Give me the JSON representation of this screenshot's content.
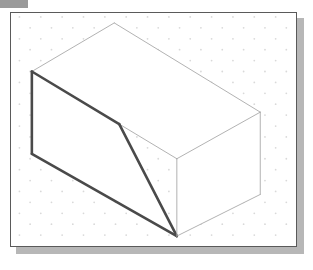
{
  "page": {
    "background_color": "#ffffff",
    "width": 313,
    "height": 270
  },
  "corner_tab": {
    "name": "page-corner-tab",
    "color": "#9a9a9a",
    "x": 0,
    "y": 0,
    "width": 28,
    "height": 8
  },
  "panel": {
    "name": "figure-panel",
    "x": 10,
    "y": 12,
    "width": 287,
    "height": 235,
    "fill": "#ffffff",
    "border_color": "#5a5a5a",
    "border_width": 1,
    "shadow_color": "#b7b7b7",
    "shadow_offset_x": 6,
    "shadow_offset_y": 6
  },
  "grid": {
    "name": "isometric-dot-grid",
    "style": "staggered-dot",
    "dot_color": "#d9d9d9",
    "dot_radius": 0.9,
    "column_spacing": 21.5,
    "row_spacing": 11.0,
    "origin_x": 19.5,
    "origin_y": 17.0,
    "columns": 14,
    "rows": 22
  },
  "figure": {
    "name": "isometric-ramp-solid",
    "line_colors": {
      "visible_heavy": "#4a4a4a",
      "visible_light": "#a8a8a8"
    },
    "line_widths": {
      "heavy": 2.6,
      "light": 0.9
    },
    "vertices": {
      "top_apex": [
        115,
        23
      ],
      "top_left": [
        32,
        72
      ],
      "top_right": [
        262,
        113
      ],
      "top_front": [
        178,
        160
      ],
      "ramp_bend_left": [
        120,
        125
      ],
      "bottom_left": [
        32,
        155
      ],
      "bottom_front": [
        178,
        238
      ],
      "bottom_right": [
        262,
        196
      ]
    },
    "faces": [
      {
        "name": "top-face",
        "points": "115,23 262,113 178,160 32,72",
        "weight": "light"
      },
      {
        "name": "ramp-face",
        "points": "32,72 120,125 178,238 32,155",
        "weight": "heavy"
      },
      {
        "name": "right-face",
        "points": "178,160 262,113 262,196 178,238",
        "weight": "light"
      }
    ],
    "edges": [
      {
        "name": "top-left-edge",
        "from": "top_apex",
        "to": "top_left",
        "weight": "light"
      },
      {
        "name": "top-right-edge",
        "from": "top_apex",
        "to": "top_right",
        "weight": "light"
      },
      {
        "name": "top-front-right-edge",
        "from": "top_right",
        "to": "top_front",
        "weight": "light"
      },
      {
        "name": "top-front-left-edge",
        "from": "top_front",
        "to": "top_left",
        "weight": "light"
      },
      {
        "name": "ramp-upper-edge",
        "from": "top_left",
        "to": "ramp_bend_left",
        "weight": "heavy"
      },
      {
        "name": "ramp-slope-edge",
        "from": "ramp_bend_left",
        "to": "bottom_front",
        "weight": "heavy"
      },
      {
        "name": "left-vertical-edge",
        "from": "top_left",
        "to": "bottom_left",
        "weight": "heavy"
      },
      {
        "name": "bottom-left-edge",
        "from": "bottom_left",
        "to": "bottom_front",
        "weight": "heavy"
      },
      {
        "name": "front-vertical-edge",
        "from": "top_front",
        "to": "bottom_front",
        "weight": "light"
      },
      {
        "name": "right-vertical-edge",
        "from": "top_right",
        "to": "bottom_right",
        "weight": "light"
      },
      {
        "name": "bottom-right-edge",
        "from": "bottom_right",
        "to": "bottom_front",
        "weight": "light"
      }
    ]
  }
}
